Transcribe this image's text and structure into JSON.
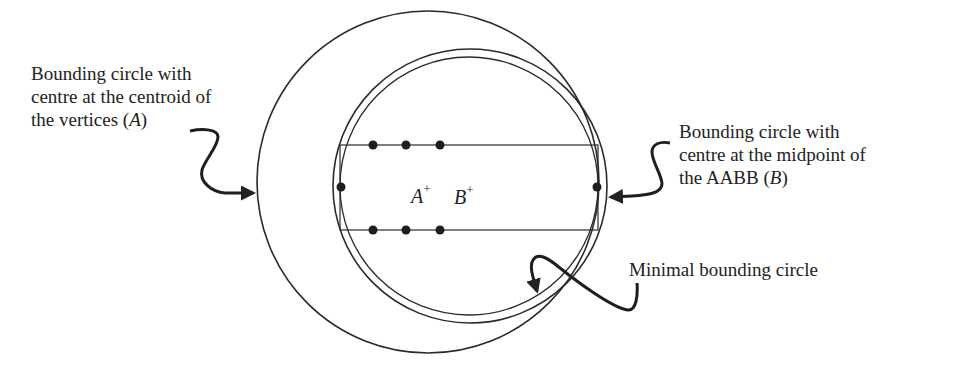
{
  "diagram": {
    "labels": {
      "circle_a": {
        "line1": "Bounding circle with",
        "line2": "centre at the centroid of",
        "line3_prefix": "the vertices (",
        "line3_var": "A",
        "line3_suffix": ")"
      },
      "circle_b": {
        "line1": "Bounding circle with",
        "line2": "centre at the midpoint of",
        "line3_prefix": "the AABB (",
        "line3_var": "B",
        "line3_suffix": ")"
      },
      "minimal": "Minimal bounding circle"
    },
    "points": {
      "a_name": "A",
      "a_mark": "+",
      "b_name": "B",
      "b_mark": "+"
    },
    "stroke_color": "#2a2a2a",
    "background": "#ffffff"
  }
}
